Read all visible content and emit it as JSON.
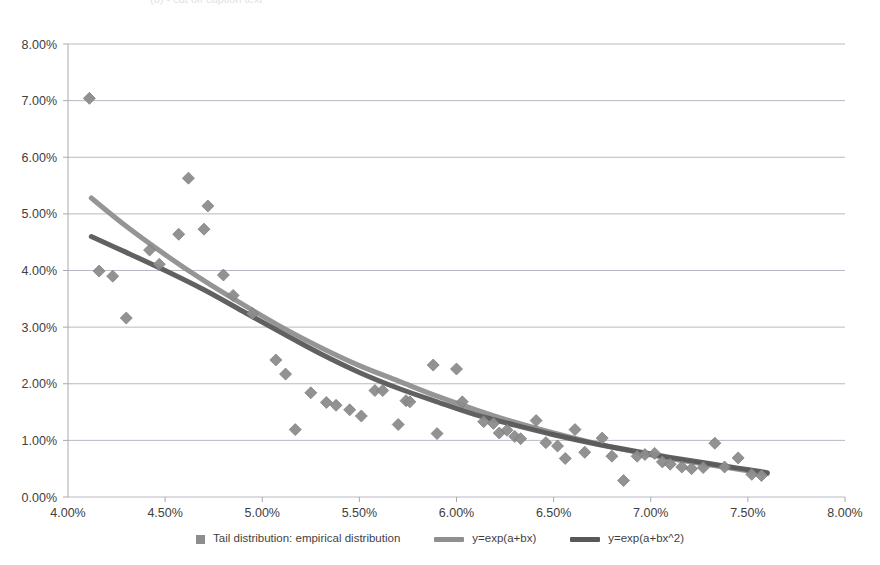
{
  "top_fragment": "(b)  -  cut off caption text",
  "legend": {
    "position": "bottom-center",
    "items": [
      {
        "label": "Tail distribution: empirical distribution",
        "kind": "marker",
        "color": "#8d8d8d"
      },
      {
        "label": "y=exp(a+bx)",
        "kind": "line",
        "color": "#8f8f8f"
      },
      {
        "label": "y=exp(a+bx^2)",
        "kind": "line",
        "color": "#585858"
      }
    ]
  },
  "chart_data": {
    "type": "scatter",
    "title": "",
    "subtitle": "",
    "xlabel": "",
    "ylabel": "",
    "xlim": [
      4.0,
      8.0
    ],
    "ylim": [
      0.0,
      8.0
    ],
    "xticks": [
      4.0,
      4.5,
      5.0,
      5.5,
      6.0,
      6.5,
      7.0,
      7.5,
      8.0
    ],
    "yticks": [
      0.0,
      1.0,
      2.0,
      3.0,
      4.0,
      5.0,
      6.0,
      7.0,
      8.0
    ],
    "xtick_labels": [
      "4.00%",
      "4.50%",
      "5.00%",
      "5.50%",
      "6.00%",
      "6.50%",
      "7.00%",
      "7.50%",
      "8.00%"
    ],
    "ytick_labels": [
      "0.00%",
      "1.00%",
      "2.00%",
      "3.00%",
      "4.00%",
      "5.00%",
      "6.00%",
      "7.00%",
      "8.00%"
    ],
    "grid": "horizontal",
    "units": "percent",
    "series": [
      {
        "name": "Tail distribution: empirical distribution",
        "type": "scatter",
        "marker": "diamond",
        "color": "#8d8d8d",
        "points": [
          [
            4.11,
            7.04
          ],
          [
            4.16,
            3.99
          ],
          [
            4.23,
            3.9
          ],
          [
            4.3,
            3.16
          ],
          [
            4.42,
            4.36
          ],
          [
            4.47,
            4.11
          ],
          [
            4.57,
            4.64
          ],
          [
            4.62,
            5.63
          ],
          [
            4.7,
            4.73
          ],
          [
            4.72,
            5.14
          ],
          [
            4.8,
            3.92
          ],
          [
            4.85,
            3.56
          ],
          [
            4.95,
            3.24
          ],
          [
            5.07,
            2.42
          ],
          [
            5.12,
            2.17
          ],
          [
            5.17,
            1.19
          ],
          [
            5.25,
            1.84
          ],
          [
            5.33,
            1.67
          ],
          [
            5.38,
            1.62
          ],
          [
            5.45,
            1.54
          ],
          [
            5.51,
            1.43
          ],
          [
            5.58,
            1.88
          ],
          [
            5.62,
            1.88
          ],
          [
            5.7,
            1.28
          ],
          [
            5.74,
            1.7
          ],
          [
            5.76,
            1.68
          ],
          [
            5.88,
            2.33
          ],
          [
            5.9,
            1.12
          ],
          [
            6.0,
            2.26
          ],
          [
            6.03,
            1.68
          ],
          [
            6.14,
            1.33
          ],
          [
            6.19,
            1.3
          ],
          [
            6.22,
            1.13
          ],
          [
            6.26,
            1.18
          ],
          [
            6.3,
            1.07
          ],
          [
            6.33,
            1.03
          ],
          [
            6.41,
            1.35
          ],
          [
            6.46,
            0.96
          ],
          [
            6.52,
            0.9
          ],
          [
            6.56,
            0.68
          ],
          [
            6.61,
            1.19
          ],
          [
            6.66,
            0.79
          ],
          [
            6.75,
            1.04
          ],
          [
            6.8,
            0.72
          ],
          [
            6.86,
            0.29
          ],
          [
            6.93,
            0.72
          ],
          [
            6.97,
            0.75
          ],
          [
            7.02,
            0.77
          ],
          [
            7.06,
            0.62
          ],
          [
            7.1,
            0.58
          ],
          [
            7.16,
            0.53
          ],
          [
            7.21,
            0.5
          ],
          [
            7.27,
            0.52
          ],
          [
            7.33,
            0.95
          ],
          [
            7.38,
            0.53
          ],
          [
            7.45,
            0.69
          ],
          [
            7.52,
            0.4
          ],
          [
            7.57,
            0.38
          ]
        ]
      },
      {
        "name": "y=exp(a+bx)",
        "type": "line",
        "color": "#8f8f8f",
        "fit_form": "y=exp(a+bx)",
        "x_range": [
          4.12,
          7.6
        ],
        "points": [
          [
            4.12,
            5.28
          ],
          [
            4.3,
            4.78
          ],
          [
            4.5,
            4.28
          ],
          [
            4.7,
            3.82
          ],
          [
            4.9,
            3.4
          ],
          [
            5.1,
            3.0
          ],
          [
            5.3,
            2.64
          ],
          [
            5.5,
            2.32
          ],
          [
            5.7,
            2.05
          ],
          [
            5.9,
            1.78
          ],
          [
            6.1,
            1.54
          ],
          [
            6.3,
            1.32
          ],
          [
            6.5,
            1.13
          ],
          [
            6.7,
            0.96
          ],
          [
            6.9,
            0.81
          ],
          [
            7.1,
            0.68
          ],
          [
            7.3,
            0.57
          ],
          [
            7.45,
            0.49
          ],
          [
            7.6,
            0.41
          ]
        ]
      },
      {
        "name": "y=exp(a+bx^2)",
        "type": "line",
        "color": "#585858",
        "fit_form": "y=exp(a+bx^2)",
        "x_range": [
          4.12,
          7.6
        ],
        "points": [
          [
            4.12,
            4.6
          ],
          [
            4.3,
            4.32
          ],
          [
            4.5,
            4.0
          ],
          [
            4.7,
            3.66
          ],
          [
            4.9,
            3.28
          ],
          [
            5.1,
            2.9
          ],
          [
            5.3,
            2.53
          ],
          [
            5.5,
            2.2
          ],
          [
            5.7,
            1.92
          ],
          [
            5.9,
            1.68
          ],
          [
            6.1,
            1.45
          ],
          [
            6.3,
            1.27
          ],
          [
            6.5,
            1.1
          ],
          [
            6.7,
            0.95
          ],
          [
            6.9,
            0.82
          ],
          [
            7.1,
            0.7
          ],
          [
            7.3,
            0.59
          ],
          [
            7.45,
            0.51
          ],
          [
            7.6,
            0.43
          ]
        ]
      }
    ]
  },
  "axes": {
    "plot_left_px": 68,
    "plot_right_px": 845,
    "plot_top_px": 44,
    "plot_bottom_px": 497,
    "grid_color": "#b9b9c4",
    "axis_color": "#a8a8b2"
  }
}
